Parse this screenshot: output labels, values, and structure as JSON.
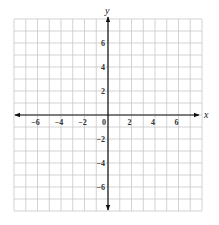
{
  "chart_data": {
    "type": "coordinate-grid",
    "title": "",
    "xlabel": "x",
    "ylabel": "y",
    "xlim": [
      -8,
      8
    ],
    "ylim": [
      -8,
      8
    ],
    "grid": true,
    "grid_step": 1,
    "x_ticks": [
      -6,
      -4,
      -2,
      0,
      2,
      4,
      6
    ],
    "x_tick_labels": [
      "−6",
      "−4",
      "−2",
      "0",
      "2",
      "4",
      "6"
    ],
    "y_ticks": [
      6,
      4,
      2,
      -2,
      -4,
      -6
    ],
    "y_tick_labels": [
      "6",
      "4",
      "2",
      "−2",
      "−4",
      "−6"
    ],
    "data": []
  },
  "colors": {
    "background": "#ffffff",
    "grid": "#c8c8c8",
    "axis": "#111111"
  }
}
